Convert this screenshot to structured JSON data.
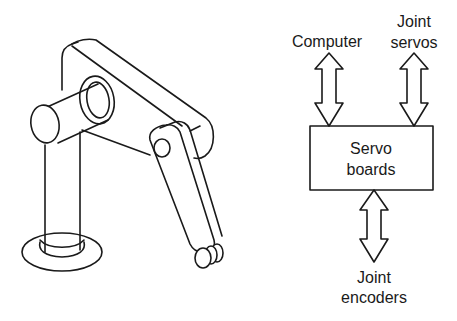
{
  "figure": {
    "left_panel": {
      "description": "robot-arm-illustration",
      "parts": [
        "base",
        "column",
        "shoulder-shaft",
        "upper-arm-link",
        "forearm-link",
        "wrist-rollers"
      ]
    },
    "right_panel": {
      "block": {
        "line1": "Servo",
        "line2": "boards"
      },
      "inputs": [
        {
          "id": "computer",
          "label_lines": [
            "Computer"
          ],
          "arrow": "bidirectional"
        },
        {
          "id": "joint-servos",
          "label_lines": [
            "Joint",
            "servos"
          ],
          "arrow": "bidirectional"
        },
        {
          "id": "joint-encoders",
          "label_lines": [
            "Joint",
            "encoders"
          ],
          "arrow": "bidirectional"
        }
      ]
    },
    "colors": {
      "ink": "#1a1a1a",
      "background": "#ffffff"
    }
  }
}
